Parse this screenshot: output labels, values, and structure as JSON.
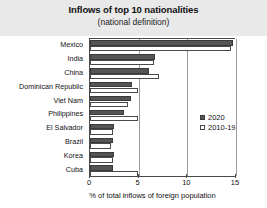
{
  "header": {
    "title": "Inflows of top 10 nationalities",
    "subtitle": "(national definition)"
  },
  "legend": {
    "items": [
      {
        "label": "2020",
        "icon": "filled-square-icon",
        "color": "#555555"
      },
      {
        "label": "2010-19",
        "icon": "hollow-square-icon",
        "color": "#ffffff"
      }
    ]
  },
  "chart_data": {
    "type": "bar",
    "orientation": "horizontal",
    "title": "Inflows of top 10 nationalities",
    "subtitle": "(national definition)",
    "xlabel": "% of total inflows of foreign population",
    "ylabel": "",
    "xlim": [
      0,
      15
    ],
    "xticks": [
      0,
      5,
      10,
      15
    ],
    "xtick_labels": [
      "0",
      "5",
      "10",
      "15"
    ],
    "grid": true,
    "legend_position": "center-right",
    "categories": [
      "Mexico",
      "India",
      "China",
      "Dominican Republic",
      "Viet Nam",
      "Philippines",
      "El Salvador",
      "Brazil",
      "Korea",
      "Cuba"
    ],
    "series": [
      {
        "name": "2020",
        "color": "#555555",
        "values": [
          14.7,
          6.7,
          6.1,
          4.3,
          4.2,
          3.5,
          2.5,
          2.4,
          2.5,
          2.4
        ]
      },
      {
        "name": "2010-19",
        "color": "#ffffff",
        "values": [
          14.5,
          6.6,
          7.1,
          4.9,
          3.9,
          4.9,
          2.4,
          2.2,
          2.4,
          4.9
        ]
      }
    ]
  }
}
